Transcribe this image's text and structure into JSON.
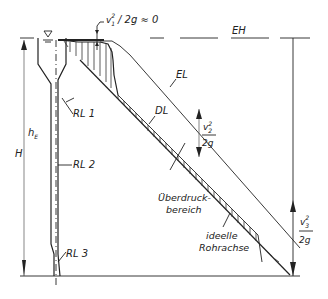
{
  "diagram": {
    "type": "hydraulic energy and pressure line diagram (Energielinie / Drucklinie)",
    "labels": {
      "energy_horizon": "EH",
      "energy_line": "EL",
      "pressure_line": "DL",
      "pipe_1": "RL 1",
      "pipe_2": "RL 2",
      "pipe_3": "RL 3",
      "entry_height": "h",
      "entry_height_sub": "E",
      "total_head": "H",
      "velocity_head_1_num": "v",
      "velocity_head_1_sup": "2",
      "velocity_head_1_sub": "1",
      "velocity_head_1_rest": "/ 2g ≈ 0",
      "velocity_head_2_num": "v",
      "velocity_head_2_sup": "2",
      "velocity_head_2_sub": "2",
      "velocity_head_2_den": "2g",
      "velocity_head_3_num": "v",
      "velocity_head_3_sup": "2",
      "velocity_head_3_sub": "3",
      "velocity_head_3_den": "2g",
      "overpressure_zone_line1": "Überdruck-",
      "overpressure_zone_line2": "bereich",
      "pipe_axis_line1": "ideelle",
      "pipe_axis_line2": "Rohrachse"
    },
    "symbols": {
      "water_level": "∇"
    },
    "colors": {
      "ink": "#222222",
      "background": "#ffffff"
    }
  }
}
